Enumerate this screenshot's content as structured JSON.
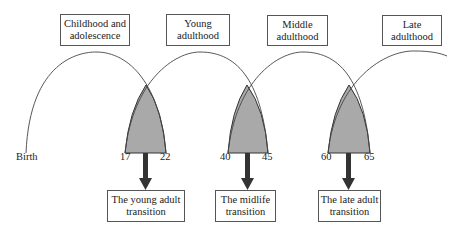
{
  "stages": [
    {
      "line1": "Childhood and",
      "line2": "adolescence"
    },
    {
      "line1": "Young",
      "line2": "adulthood"
    },
    {
      "line1": "Middle",
      "line2": "adulthood"
    },
    {
      "line1": "Late",
      "line2": "adulthood"
    }
  ],
  "start_label": "Birth",
  "transitions": [
    {
      "start_age": "17",
      "end_age": "22",
      "line1": "The young adult",
      "line2": "transition"
    },
    {
      "start_age": "40",
      "end_age": "45",
      "line1": "The midlife",
      "line2": "transition"
    },
    {
      "start_age": "60",
      "end_age": "65",
      "line1": "The late adult",
      "line2": "transition"
    }
  ],
  "colors": {
    "shade": "#a9a9a9",
    "arrow": "#333333",
    "line": "#444444"
  }
}
